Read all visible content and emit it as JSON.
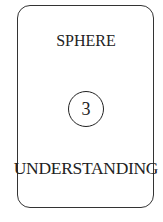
{
  "card": {
    "title": "SPHERE",
    "number": "3",
    "label": "UNDERSTANDING"
  },
  "colors": {
    "border": "#333333",
    "text": "#222222",
    "background": "#ffffff"
  }
}
